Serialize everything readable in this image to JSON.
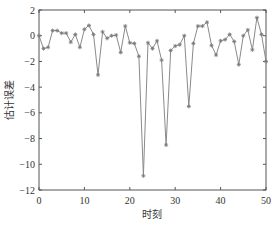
{
  "chart_data": {
    "type": "line",
    "title": "",
    "xlabel": "时刻",
    "ylabel": "估计误差",
    "xlim": [
      0,
      50
    ],
    "ylim": [
      -12,
      2
    ],
    "xticks": [
      0,
      10,
      20,
      30,
      40,
      50
    ],
    "yticks": [
      2,
      0,
      -2,
      -4,
      -6,
      -8,
      -10,
      -12
    ],
    "xtick_labels": [
      "0",
      "10",
      "20",
      "30",
      "40",
      "50"
    ],
    "ytick_labels": [
      "2",
      "0",
      "−2",
      "−4",
      "−6",
      "−8",
      "−10",
      "−12"
    ],
    "grid": false,
    "legend": null,
    "marker": "asterisk",
    "line_color": "#8a8a8a",
    "marker_color": "#7a7a7a",
    "axis_color": "#555555",
    "series": [
      {
        "name": "估计误差",
        "x": [
          0,
          1,
          2,
          3,
          4,
          5,
          6,
          7,
          8,
          9,
          10,
          11,
          12,
          13,
          14,
          15,
          16,
          17,
          18,
          19,
          20,
          21,
          22,
          23,
          24,
          25,
          26,
          27,
          28,
          29,
          30,
          31,
          32,
          33,
          34,
          35,
          36,
          37,
          38,
          39,
          40,
          41,
          42,
          43,
          44,
          45,
          46,
          47,
          48,
          49,
          50
        ],
        "values": [
          0.0,
          -1.0,
          -0.9,
          0.4,
          0.4,
          0.2,
          0.2,
          -0.5,
          0.1,
          -0.9,
          0.5,
          0.8,
          0.1,
          -3.05,
          0.3,
          -0.2,
          0.0,
          0.05,
          -1.3,
          0.75,
          -0.55,
          -0.6,
          -1.6,
          -10.9,
          -0.55,
          -1.0,
          -0.4,
          -1.9,
          -8.5,
          -1.15,
          -0.8,
          -0.7,
          0.0,
          -5.5,
          -0.6,
          0.75,
          0.75,
          1.05,
          -0.75,
          -1.5,
          -0.4,
          -0.3,
          0.1,
          -0.45,
          -2.25,
          0.0,
          0.45,
          -1.1,
          1.4,
          0.1,
          -2.0
        ]
      }
    ]
  }
}
